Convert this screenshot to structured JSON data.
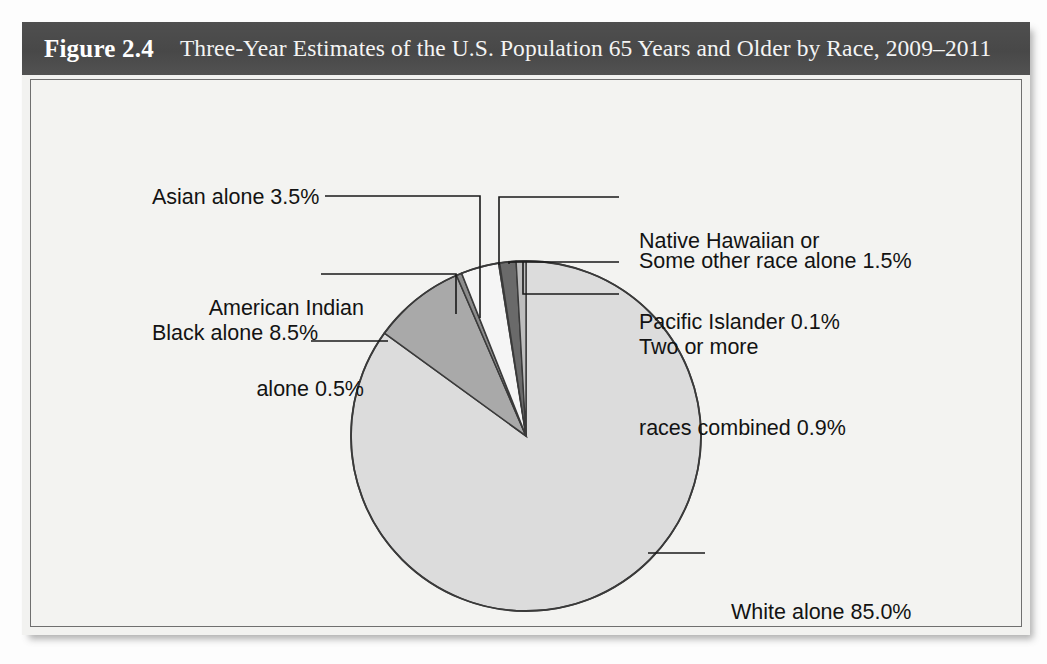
{
  "figure": {
    "number": "Figure 2.4",
    "caption": "Three-Year Estimates of the U.S. Population 65 Years and Older by Race, 2009–2011"
  },
  "colors": {
    "title_bar": "#4d4d4d",
    "panel_bg": "#f3f3f1",
    "white_alone": "#dcdcdc",
    "black_alone": "#a9a9a9",
    "american_indian": "#8c8c8c",
    "asian_alone": "#f5f5f5",
    "native_hawaiian": "#c9c9c9",
    "some_other_race": "#6a6a6a",
    "two_or_more": "#bdbdbd",
    "outline": "#3a3a3a",
    "leader_line": "#1a1a1a"
  },
  "chart_data": {
    "type": "pie",
    "title": "Three-Year Estimates of the U.S. Population 65 Years and Older by Race, 2009–2011",
    "xlabel": "",
    "ylabel": "",
    "legend_position": "callout-labels",
    "grid": false,
    "units": "percent",
    "categories": [
      "White alone",
      "Black alone",
      "Asian alone",
      "American Indian alone",
      "Native Hawaiian or Pacific Islander",
      "Some other race alone",
      "Two or more races combined"
    ],
    "values": [
      85.0,
      8.5,
      3.5,
      0.5,
      0.1,
      1.5,
      0.9
    ],
    "slices": [
      {
        "name": "White alone",
        "value": 85.0,
        "label": "White alone 85.0%",
        "color": "#dcdcdc",
        "start_angle_deg": 0.0,
        "end_angle_deg": 306.0
      },
      {
        "name": "Black alone",
        "value": 8.5,
        "label": "Black alone 8.5%",
        "color": "#a9a9a9",
        "start_angle_deg": 306.0,
        "end_angle_deg": 336.6
      },
      {
        "name": "American Indian alone",
        "value": 0.5,
        "label_line_1": "American Indian",
        "label_line_2": "alone 0.5%",
        "color": "#8c8c8c",
        "start_angle_deg": 336.6,
        "end_angle_deg": 338.4
      },
      {
        "name": "Asian alone",
        "value": 3.5,
        "label": "Asian alone 3.5%",
        "color": "#f5f5f5",
        "start_angle_deg": 338.4,
        "end_angle_deg": 351.0
      },
      {
        "name": "Native Hawaiian or Pacific Islander",
        "value": 0.1,
        "label_line_1": "Native Hawaiian or",
        "label_line_2": "Pacific Islander 0.1%",
        "color": "#c9c9c9",
        "start_angle_deg": 351.0,
        "end_angle_deg": 351.36
      },
      {
        "name": "Some other race alone",
        "value": 1.5,
        "label": "Some other race alone 1.5%",
        "color": "#6a6a6a",
        "start_angle_deg": 351.36,
        "end_angle_deg": 356.76
      },
      {
        "name": "Two or more races combined",
        "value": 0.9,
        "label_line_1": "Two or more",
        "label_line_2": "races combined 0.9%",
        "color": "#bdbdbd",
        "start_angle_deg": 356.76,
        "end_angle_deg": 360.0
      }
    ]
  },
  "labels": {
    "asian": "Asian alone 3.5%",
    "american_indian_line1": "American Indian",
    "american_indian_line2": "alone 0.5%",
    "black": "Black alone 8.5%",
    "native_hawaiian_line1": "Native Hawaiian or",
    "native_hawaiian_line2": "Pacific Islander 0.1%",
    "some_other_race": "Some other race alone 1.5%",
    "two_or_more_line1": "Two or more",
    "two_or_more_line2": "races combined 0.9%",
    "white": "White alone 85.0%"
  }
}
